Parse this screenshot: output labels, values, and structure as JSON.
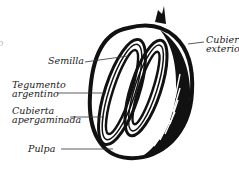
{
  "diagram": {
    "labels": {
      "semilla": "Semilla",
      "tegumento_1": "Tegumento",
      "tegumento_2": "argentino",
      "cubierta_aperg_1": "Cubierta",
      "cubierta_aperg_2": "apergaminada",
      "pulpa": "Pulpa",
      "cubierta_ext_1": "Cubierta",
      "cubierta_ext_2": "exterior"
    },
    "edge_fragments": [
      "o",
      "Te",
      "ar",
      "Cu",
      "ap"
    ],
    "colors": {
      "ink": "#111111",
      "text": "#222222",
      "background": "#ffffff"
    }
  }
}
